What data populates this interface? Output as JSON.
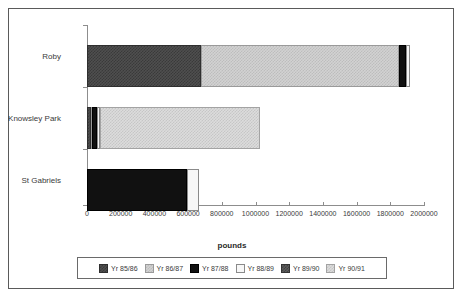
{
  "caption": "",
  "chart_data": {
    "type": "bar",
    "orientation": "horizontal",
    "stacked": true,
    "title": "",
    "xlabel": "pounds",
    "ylabel": "",
    "xlim": [
      0,
      2000000
    ],
    "grid": false,
    "legend_position": "bottom",
    "categories": [
      "Roby",
      "Knowsley Park",
      "St Gabriels"
    ],
    "xticks": [
      "0",
      "200000",
      "400000",
      "600000",
      "800000",
      "1000000",
      "1200000",
      "1400000",
      "1600000",
      "1800000",
      "2000000"
    ],
    "series": [
      {
        "name": "Yr 85/86",
        "values": [
          676000,
          24000,
          594000
        ]
      },
      {
        "name": "Yr 86/87",
        "values": [
          1175000,
          30000,
          0
        ]
      },
      {
        "name": "Yr 87/88",
        "values": [
          41000,
          18000,
          0
        ]
      },
      {
        "name": "Yr 88/89",
        "values": [
          24000,
          950000,
          71000
        ]
      },
      {
        "name": "Yr 89/90",
        "values": [
          0,
          0,
          0
        ]
      },
      {
        "name": "Yr 90/91",
        "values": [
          0,
          0,
          0
        ]
      }
    ],
    "totals": [
      1916000,
      1022000,
      665000
    ]
  },
  "legend": {
    "items": [
      {
        "label": "Yr 85/86",
        "fill": "fill-85"
      },
      {
        "label": "Yr 86/87",
        "fill": "fill-86"
      },
      {
        "label": "Yr 87/88",
        "fill": "fill-87"
      },
      {
        "label": "Yr 88/89",
        "fill": "fill-88"
      },
      {
        "label": "Yr 89/90",
        "fill": "fill-89"
      },
      {
        "label": "Yr 90/91",
        "fill": "fill-90"
      }
    ]
  },
  "bars": [
    {
      "category": "Roby",
      "top": 20,
      "label_top": 43,
      "segments": [
        {
          "series": "Yr 85/86",
          "fill": "fill-85",
          "left": 0,
          "width": 114
        },
        {
          "series": "Yr 86/87",
          "fill": "fill-86",
          "left": 114,
          "width": 198
        },
        {
          "series": "Yr 87/88",
          "fill": "fill-87",
          "left": 312,
          "width": 7
        },
        {
          "series": "Yr 88/89",
          "fill": "fill-88",
          "left": 319,
          "width": 4
        }
      ]
    },
    {
      "category": "Knowsley Park",
      "top": 82,
      "label_top": 105,
      "segments": [
        {
          "series": "Yr 85/86",
          "fill": "fill-85",
          "left": 0,
          "width": 4
        },
        {
          "series": "Yr 86/87",
          "fill": "fill-86",
          "left": 4,
          "width": 1
        },
        {
          "series": "Yr 87/88",
          "fill": "fill-87",
          "left": 5,
          "width": 5
        },
        {
          "series": "Yr 88/89",
          "fill": "fill-88",
          "left": 10,
          "width": 3
        },
        {
          "series": "Yr 90/91",
          "fill": "fill-90",
          "left": 13,
          "width": 160
        }
      ]
    },
    {
      "category": "St Gabriels",
      "top": 144,
      "label_top": 167,
      "segments": [
        {
          "series": "Yr 87/88",
          "fill": "fill-87",
          "left": 0,
          "width": 100
        },
        {
          "series": "Yr 88/89",
          "fill": "fill-88",
          "left": 100,
          "width": 12
        }
      ]
    }
  ],
  "axis": {
    "left_px": 78,
    "top_px": 16,
    "width_px": 337,
    "height_px": 180,
    "tick_spacing_px": 33.7
  }
}
